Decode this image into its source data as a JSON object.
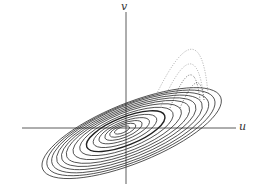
{
  "figure": {
    "type": "phase-plane portrait",
    "axes": {
      "x_label": "u",
      "y_label": "v",
      "origin": [
        126,
        128
      ]
    },
    "colors": {
      "stroke": "#222222",
      "dotted": "#888888",
      "background": "#ffffff"
    }
  }
}
